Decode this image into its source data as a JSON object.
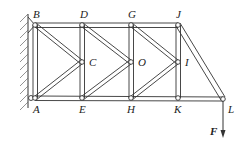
{
  "diagram": {
    "type": "plane-truss",
    "support": "fixed-wall-left-pins",
    "nodes": [
      {
        "id": "B",
        "label": "B",
        "x": 35,
        "y": 25
      },
      {
        "id": "D",
        "label": "D",
        "x": 82,
        "y": 25
      },
      {
        "id": "G",
        "label": "G",
        "x": 131,
        "y": 25
      },
      {
        "id": "J",
        "label": "J",
        "x": 178,
        "y": 25
      },
      {
        "id": "C",
        "label": "C",
        "x": 82,
        "y": 62
      },
      {
        "id": "O",
        "label": "O",
        "x": 131,
        "y": 62
      },
      {
        "id": "I",
        "label": "I",
        "x": 178,
        "y": 62
      },
      {
        "id": "A",
        "label": "A",
        "x": 35,
        "y": 98
      },
      {
        "id": "E",
        "label": "E",
        "x": 82,
        "y": 98
      },
      {
        "id": "H",
        "label": "H",
        "x": 131,
        "y": 98
      },
      {
        "id": "K",
        "label": "K",
        "x": 178,
        "y": 98
      },
      {
        "id": "L",
        "label": "L",
        "x": 223,
        "y": 99
      }
    ],
    "members": [
      [
        "B",
        "D"
      ],
      [
        "D",
        "G"
      ],
      [
        "G",
        "J"
      ],
      [
        "A",
        "E"
      ],
      [
        "E",
        "H"
      ],
      [
        "H",
        "K"
      ],
      [
        "K",
        "L"
      ],
      [
        "B",
        "A"
      ],
      [
        "D",
        "E"
      ],
      [
        "G",
        "H"
      ],
      [
        "J",
        "K"
      ],
      [
        "B",
        "C"
      ],
      [
        "A",
        "C"
      ],
      [
        "D",
        "O"
      ],
      [
        "E",
        "O"
      ],
      [
        "G",
        "I"
      ],
      [
        "H",
        "I"
      ],
      [
        "J",
        "L"
      ]
    ],
    "load": {
      "label": "F",
      "node": "L",
      "direction": "down"
    },
    "colors": {
      "line": "#333333",
      "hatch": "#666666"
    }
  }
}
